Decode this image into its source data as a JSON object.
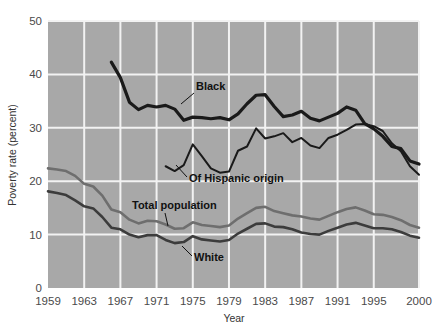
{
  "chart_data": {
    "type": "line",
    "title": "",
    "xlabel": "Year",
    "ylabel": "Poverty rate (percent)",
    "xlim": [
      1959,
      2000
    ],
    "ylim": [
      0,
      50
    ],
    "yticks": [
      0,
      10,
      20,
      30,
      40,
      50
    ],
    "ytick_labels": [
      "0",
      "10",
      "20",
      "30",
      "40",
      "50"
    ],
    "xticks": [
      1959,
      1963,
      1967,
      1971,
      1975,
      1979,
      1983,
      1987,
      1991,
      1995,
      2000
    ],
    "xtick_labels": [
      "1959",
      "1963",
      "1967",
      "1971",
      "1975",
      "1979",
      "1983",
      "1987",
      "1991",
      "1995",
      "2000"
    ],
    "grid": "horizontal-and-vertical, white lines on gray panel",
    "legend": "inline annotations with leader lines",
    "plot_background": "#a8a8a8",
    "grid_color": "#f2f2f2",
    "series": [
      {
        "name": "Black",
        "color": "#1a1a1a",
        "width": 3.2,
        "label": "Black",
        "label_x": 196,
        "label_y": 90,
        "leader": [
          [
            194,
            93
          ],
          [
            181,
            104
          ]
        ],
        "x": [
          1966,
          1967,
          1968,
          1969,
          1970,
          1971,
          1972,
          1973,
          1974,
          1975,
          1976,
          1977,
          1978,
          1979,
          1980,
          1981,
          1982,
          1983,
          1984,
          1985,
          1986,
          1987,
          1988,
          1989,
          1990,
          1991,
          1992,
          1993,
          1994,
          1995,
          1996,
          1997,
          1998,
          1999,
          2000
        ],
        "y": [
          42.3,
          39.4,
          34.8,
          33.4,
          34.2,
          33.9,
          34.2,
          33.5,
          31.4,
          32.0,
          31.9,
          31.7,
          31.9,
          31.5,
          32.6,
          34.5,
          36.1,
          36.2,
          34.0,
          32.1,
          32.4,
          33.1,
          31.8,
          31.3,
          32.0,
          32.7,
          33.9,
          33.3,
          30.8,
          29.8,
          28.4,
          26.5,
          26.1,
          23.8,
          23.2
        ]
      },
      {
        "name": "Of Hispanic origin",
        "color": "#1a1a1a",
        "width": 2.0,
        "label": "Of Hispanic origin",
        "label_x": 189,
        "label_y": 182,
        "leader": [
          [
            187,
            177
          ],
          [
            176,
            165
          ]
        ],
        "x": [
          1972,
          1973,
          1974,
          1975,
          1976,
          1977,
          1978,
          1979,
          1980,
          1981,
          1982,
          1983,
          1984,
          1985,
          1986,
          1987,
          1988,
          1989,
          1990,
          1991,
          1992,
          1993,
          1994,
          1995,
          1996,
          1997,
          1998,
          1999,
          2000
        ],
        "y": [
          22.8,
          21.9,
          23.0,
          26.9,
          24.7,
          22.4,
          21.6,
          21.8,
          25.7,
          26.5,
          29.9,
          28.0,
          28.4,
          29.0,
          27.3,
          28.1,
          26.7,
          26.2,
          28.1,
          28.7,
          29.6,
          30.6,
          30.7,
          30.3,
          29.4,
          27.1,
          25.6,
          22.8,
          21.2
        ]
      },
      {
        "name": "Total population",
        "color": "#6e6e6e",
        "width": 2.6,
        "label": "Total population",
        "label_x": 132,
        "label_y": 209,
        "leader": [
          [
            165,
            213
          ],
          [
            168,
            226
          ]
        ],
        "x": [
          1959,
          1960,
          1961,
          1962,
          1963,
          1964,
          1965,
          1966,
          1967,
          1968,
          1969,
          1970,
          1971,
          1972,
          1973,
          1974,
          1975,
          1976,
          1977,
          1978,
          1979,
          1980,
          1981,
          1982,
          1983,
          1984,
          1985,
          1986,
          1987,
          1988,
          1989,
          1990,
          1991,
          1992,
          1993,
          1994,
          1995,
          1996,
          1997,
          1998,
          1999,
          2000
        ],
        "y": [
          22.4,
          22.2,
          21.9,
          21.0,
          19.5,
          19.0,
          17.3,
          14.7,
          14.2,
          12.8,
          12.1,
          12.6,
          12.5,
          11.9,
          11.1,
          11.2,
          12.3,
          11.8,
          11.6,
          11.4,
          11.7,
          13.0,
          14.0,
          15.0,
          15.2,
          14.4,
          14.0,
          13.6,
          13.4,
          13.0,
          12.8,
          13.5,
          14.2,
          14.8,
          15.1,
          14.5,
          13.8,
          13.7,
          13.3,
          12.7,
          11.8,
          11.3
        ]
      },
      {
        "name": "White",
        "color": "#3c3c3c",
        "width": 2.6,
        "label": "White",
        "label_x": 194,
        "label_y": 261,
        "leader": [
          [
            192,
            256
          ],
          [
            182,
            246
          ]
        ],
        "x": [
          1959,
          1960,
          1961,
          1962,
          1963,
          1964,
          1965,
          1966,
          1967,
          1968,
          1969,
          1970,
          1971,
          1972,
          1973,
          1974,
          1975,
          1976,
          1977,
          1978,
          1979,
          1980,
          1981,
          1982,
          1983,
          1984,
          1985,
          1986,
          1987,
          1988,
          1989,
          1990,
          1991,
          1992,
          1993,
          1994,
          1995,
          1996,
          1997,
          1998,
          1999,
          2000
        ],
        "y": [
          18.1,
          17.8,
          17.4,
          16.4,
          15.3,
          14.9,
          13.3,
          11.3,
          11.0,
          10.0,
          9.5,
          9.9,
          9.9,
          9.0,
          8.4,
          8.6,
          9.7,
          9.1,
          8.9,
          8.7,
          9.0,
          10.2,
          11.1,
          12.0,
          12.1,
          11.5,
          11.4,
          11.0,
          10.4,
          10.1,
          10.0,
          10.7,
          11.3,
          11.9,
          12.2,
          11.7,
          11.2,
          11.2,
          11.0,
          10.5,
          9.8,
          9.4
        ]
      }
    ]
  },
  "axes": {
    "ylabel": "Poverty rate (percent)",
    "xlabel": "Year"
  }
}
